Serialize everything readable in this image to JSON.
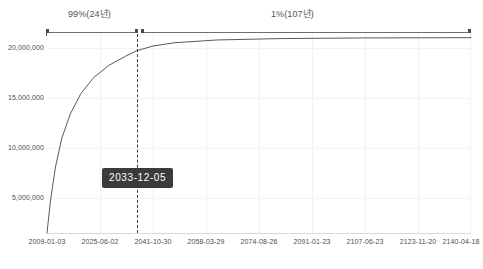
{
  "chart_data": {
    "type": "line",
    "title": "",
    "xlabel": "",
    "ylabel": "",
    "grid": true,
    "legend_position": "bottom",
    "ylim": [
      0,
      21500000
    ],
    "yticks": [
      5000000,
      10000000,
      15000000,
      20000000
    ],
    "ytick_labels": [
      "5,000,000",
      "10,000,000",
      "15,000,000",
      "20,000,000"
    ],
    "xtick_labels": [
      "2009-01-03",
      "2025-06-02",
      "2041-10-30",
      "2058-03-29",
      "2074-08-26",
      "2091-01-23",
      "2107-06-23",
      "2123-11-20",
      "2140-04-18"
    ],
    "x": [
      "2009-01-03",
      "2025-06-02",
      "2041-10-30",
      "2058-03-29",
      "2074-08-26",
      "2091-01-23",
      "2107-06-23",
      "2123-11-20",
      "2140-04-18"
    ],
    "series": [
      {
        "name": "cumulative-supply",
        "values": [
          0,
          19200000,
          20700000,
          20850000,
          20930000,
          20970000,
          20990000,
          21000000,
          21000000
        ]
      }
    ],
    "curve_points": [
      {
        "t": 0.0,
        "v": 0
      },
      {
        "t": 0.008,
        "v": 3400000
      },
      {
        "t": 0.02,
        "v": 7100000
      },
      {
        "t": 0.035,
        "v": 10200000
      },
      {
        "t": 0.055,
        "v": 12800000
      },
      {
        "t": 0.08,
        "v": 15000000
      },
      {
        "t": 0.11,
        "v": 16700000
      },
      {
        "t": 0.145,
        "v": 18000000
      },
      {
        "t": 0.185,
        "v": 19000000
      },
      {
        "t": 0.212,
        "v": 19600000
      },
      {
        "t": 0.25,
        "v": 20100000
      },
      {
        "t": 0.3,
        "v": 20450000
      },
      {
        "t": 0.4,
        "v": 20750000
      },
      {
        "t": 0.55,
        "v": 20900000
      },
      {
        "t": 0.75,
        "v": 20970000
      },
      {
        "t": 1.0,
        "v": 21000000
      }
    ],
    "annotations": {
      "phase_left": "99%(24년)",
      "phase_right": "1%(107년)",
      "marker_date": "2033-12-05",
      "marker_x_fraction": 0.212
    }
  },
  "tooltip": {
    "label": "2033-12-05"
  },
  "bottom_caption": {
    "text": ""
  }
}
